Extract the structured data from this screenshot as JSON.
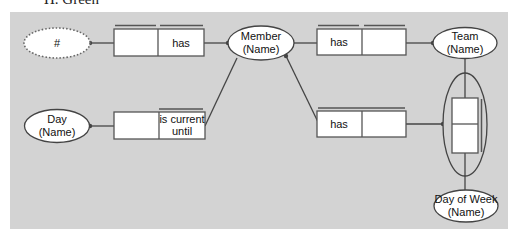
{
  "caption": "H. Green",
  "diagram": {
    "type": "ORM fact-type diagram",
    "colors": {
      "background": "#d3d3d3",
      "shape_fill": "#ffffff",
      "stroke": "#444444"
    },
    "entities": [
      {
        "id": "hash",
        "label": "#",
        "style": "dotted"
      },
      {
        "id": "member",
        "line1": "Member",
        "line2": "(Name)"
      },
      {
        "id": "team",
        "line1": "Team",
        "line2": "(Name)"
      },
      {
        "id": "day",
        "line1": "Day",
        "line2": "(Name)"
      },
      {
        "id": "dayofweek",
        "line1": "Day of Week",
        "line2": "(Name)"
      }
    ],
    "fact_types": [
      {
        "id": "f1",
        "roles": [
          "",
          "has"
        ]
      },
      {
        "id": "f2",
        "roles": [
          "has",
          ""
        ]
      },
      {
        "id": "f3",
        "roles": [
          "",
          "is current until"
        ],
        "role2_line1": "is current",
        "role2_line2": "until"
      },
      {
        "id": "f4",
        "roles": [
          "has",
          ""
        ]
      },
      {
        "id": "f5",
        "roles": [
          "",
          ""
        ],
        "nested": true
      }
    ]
  }
}
